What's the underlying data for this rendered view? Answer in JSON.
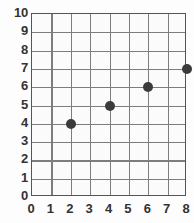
{
  "chart_data": {
    "type": "scatter",
    "title": "",
    "subtitle": "",
    "xlabel": "",
    "ylabel": "",
    "xlim": [
      0,
      8
    ],
    "ylim": [
      0,
      10
    ],
    "xticks": [
      "0",
      "1",
      "2",
      "3",
      "4",
      "5",
      "6",
      "7",
      "8"
    ],
    "yticks": [
      "0",
      "1",
      "2",
      "3",
      "4",
      "5",
      "6",
      "7",
      "8",
      "9",
      "10"
    ],
    "grid": true,
    "legend": null,
    "annotations": [],
    "points": [
      {
        "x": 2,
        "y": 4,
        "label": "(2, 4)"
      },
      {
        "x": 4,
        "y": 5,
        "label": "(4, 5)"
      },
      {
        "x": 6,
        "y": 6,
        "label": "(6, 6)"
      },
      {
        "x": 8,
        "y": 7,
        "label": "(8, 7)"
      }
    ],
    "series": [
      {
        "name": "",
        "x": [
          2,
          4,
          6,
          8
        ],
        "values": [
          4,
          5,
          6,
          7
        ]
      }
    ],
    "colors": {
      "marker": "#3b3b3b",
      "gridline": "#7d7d7d",
      "axis": "#555555",
      "plot_background": "#fbfbfb",
      "page_background": "#fdfdfd",
      "tick_label": "#333333"
    }
  }
}
